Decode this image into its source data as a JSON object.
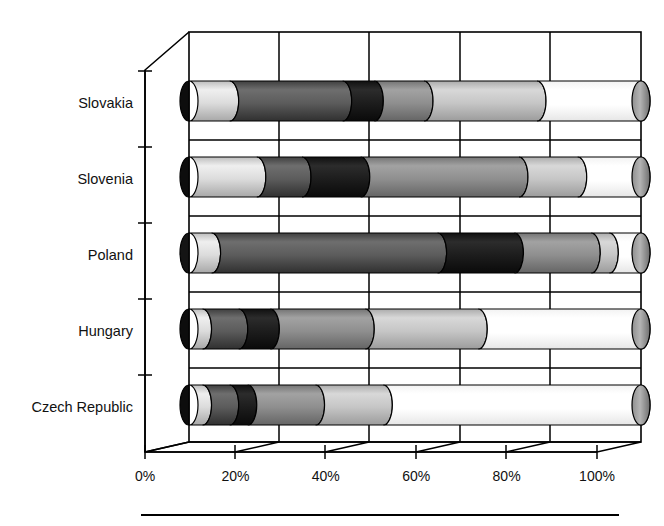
{
  "chart_data": {
    "type": "bar",
    "orientation": "horizontal",
    "stacked": true,
    "percent_stacked": true,
    "style": "3d-cylinder",
    "title": "",
    "subtitle": "",
    "xlabel": "",
    "ylabel": "",
    "xlim": [
      0,
      100
    ],
    "xtick_labels": [
      "0%",
      "20%",
      "40%",
      "60%",
      "80%",
      "100%"
    ],
    "xtick_values": [
      0,
      20,
      40,
      60,
      80,
      100
    ],
    "grid": true,
    "legend": false,
    "legend_position": "bottom",
    "categories": [
      "Slovakia",
      "Slovenia",
      "Poland",
      "Hungary",
      "Czech Republic"
    ],
    "series": [
      {
        "name": "Segment 1",
        "color": "#d8d8d8",
        "values": [
          9,
          15,
          5,
          3,
          3
        ]
      },
      {
        "name": "Segment 2",
        "color": "#585858",
        "values": [
          25,
          10,
          50,
          8,
          6
        ]
      },
      {
        "name": "Segment 3",
        "color": "#1e1e1e",
        "values": [
          7,
          13,
          17,
          7,
          4
        ]
      },
      {
        "name": "Segment 4",
        "color": "#8c8c8c",
        "values": [
          11,
          35,
          17,
          21,
          15
        ]
      },
      {
        "name": "Segment 5",
        "color": "#c4c4c4",
        "values": [
          25,
          13,
          4,
          25,
          15
        ]
      },
      {
        "name": "Segment 6",
        "color": "#ffffff",
        "values": [
          23,
          14,
          7,
          36,
          57
        ]
      }
    ],
    "bar_values_by_category": {
      "Slovakia": [
        9,
        25,
        7,
        11,
        25,
        23
      ],
      "Slovenia": [
        15,
        10,
        13,
        35,
        13,
        14
      ],
      "Poland": [
        5,
        50,
        17,
        17,
        4,
        7
      ],
      "Hungary": [
        3,
        8,
        7,
        21,
        25,
        36
      ],
      "Czech Republic": [
        3,
        6,
        4,
        15,
        15,
        57
      ]
    },
    "segment_colors": [
      "#d8d8d8",
      "#585858",
      "#1e1e1e",
      "#8c8c8c",
      "#c4c4c4",
      "#ffffff"
    ]
  },
  "axis": {
    "x_ticks": [
      {
        "label": "0%",
        "value": 0
      },
      {
        "label": "20%",
        "value": 20
      },
      {
        "label": "40%",
        "value": 40
      },
      {
        "label": "60%",
        "value": 60
      },
      {
        "label": "80%",
        "value": 80
      },
      {
        "label": "100%",
        "value": 100
      }
    ],
    "categories": [
      {
        "label": "Slovakia"
      },
      {
        "label": "Slovenia"
      },
      {
        "label": "Poland"
      },
      {
        "label": "Hungary"
      },
      {
        "label": "Czech Republic"
      }
    ]
  },
  "colors": {
    "background": "#ffffff",
    "axis": "#000000",
    "gridline": "#000000",
    "text": "#111111"
  }
}
